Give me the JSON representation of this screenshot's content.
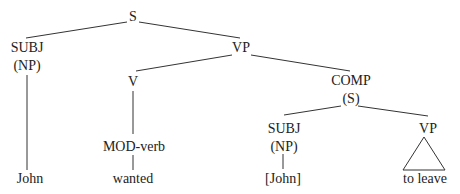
{
  "diagram": {
    "type": "syntax-tree",
    "nodes": {
      "root": {
        "label": "S"
      },
      "subj1": {
        "label": "SUBJ",
        "sub": "(NP)"
      },
      "vp1": {
        "label": "VP"
      },
      "v": {
        "label": "V"
      },
      "comp": {
        "label": "COMP",
        "sub": "(S)"
      },
      "modverb": {
        "label": "MOD-verb"
      },
      "subj2": {
        "label": "SUBJ",
        "sub": "(NP)"
      },
      "vp2": {
        "label": "VP"
      }
    },
    "leaves": {
      "john": "John",
      "wanted": "wanted",
      "john_bracket": "[John]",
      "to_leave": "to leave"
    },
    "edges": [
      [
        "root",
        "subj1"
      ],
      [
        "root",
        "vp1"
      ],
      [
        "vp1",
        "v"
      ],
      [
        "vp1",
        "comp"
      ],
      [
        "subj1",
        "john"
      ],
      [
        "v",
        "modverb"
      ],
      [
        "modverb",
        "wanted"
      ],
      [
        "comp",
        "subj2"
      ],
      [
        "comp",
        "vp2"
      ],
      [
        "subj2",
        "john_bracket"
      ],
      [
        "vp2",
        "to_leave (triangle)"
      ]
    ]
  }
}
